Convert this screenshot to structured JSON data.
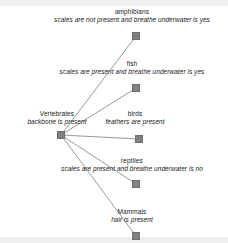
{
  "diagram": {
    "type": "decision-tree",
    "background_color": "#ffffff",
    "node_color": "#808080",
    "edge_color": "#9a9a9a",
    "band_color": "#f0f0f0",
    "nodes": [
      {
        "id": "vertebrates",
        "name": "Vertebrates",
        "desc": "backbone is present",
        "x": 57,
        "y": 131,
        "label_x": 57,
        "label_y": 110,
        "role": "root"
      },
      {
        "id": "amphibians",
        "name": "amphibians",
        "desc": "scales are not present and breathe underwater is yes",
        "x": 132,
        "y": 32,
        "label_x": 132,
        "label_y": 8,
        "role": "leaf"
      },
      {
        "id": "fish",
        "name": "fish",
        "desc": "scales are present and breathe underwater is yes",
        "x": 132,
        "y": 84,
        "label_x": 132,
        "label_y": 60,
        "role": "leaf"
      },
      {
        "id": "birds",
        "name": "birds",
        "desc": "feathers are present",
        "x": 135,
        "y": 135,
        "label_x": 135,
        "label_y": 110,
        "role": "leaf"
      },
      {
        "id": "reptiles",
        "name": "reptiles",
        "desc": "scales are present and breathe underwater is no",
        "x": 132,
        "y": 180,
        "label_x": 132,
        "label_y": 157,
        "role": "leaf"
      },
      {
        "id": "mammals",
        "name": "Mammals",
        "desc": "hair is present",
        "x": 132,
        "y": 232,
        "label_x": 132,
        "label_y": 208,
        "role": "leaf"
      }
    ],
    "edges": [
      {
        "from": "vertebrates",
        "to": "amphibians"
      },
      {
        "from": "vertebrates",
        "to": "fish"
      },
      {
        "from": "vertebrates",
        "to": "birds"
      },
      {
        "from": "vertebrates",
        "to": "reptiles"
      },
      {
        "from": "vertebrates",
        "to": "mammals"
      }
    ]
  }
}
